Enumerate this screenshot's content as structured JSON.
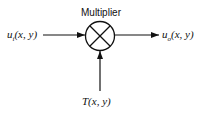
{
  "diagram": {
    "block_label": "Multiplier",
    "block_symbol": "multiply-cross",
    "input_left": {
      "base": "u",
      "sub": "i",
      "args": "(x, y)"
    },
    "output_right": {
      "base": "u",
      "sub": "o",
      "args": "(x, y)"
    },
    "input_bottom": {
      "text": "T(x, y)"
    },
    "colors": {
      "stroke": "#111111",
      "background": "#ffffff"
    }
  }
}
